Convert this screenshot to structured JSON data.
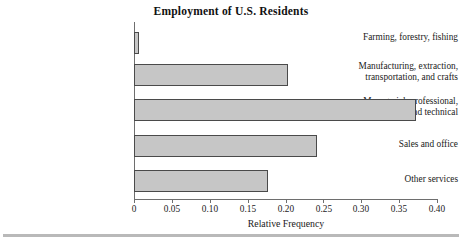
{
  "chart_data": {
    "type": "bar",
    "orientation": "horizontal",
    "title": "Employment of U.S. Residents",
    "xlabel": "Relative Frequency",
    "ylabel": "",
    "xlim": [
      0,
      0.4
    ],
    "grid": false,
    "legend": null,
    "categories": [
      "Farming, forestry, fishing",
      "Manufacturing, extraction, transportation, and crafts",
      "Managerial, professional, and technical",
      "Sales and office",
      "Other services"
    ],
    "category_lines": [
      [
        "Farming, forestry, fishing"
      ],
      [
        "Manufacturing, extraction,",
        "transportation, and crafts"
      ],
      [
        "Managerial, professional,",
        "and technical"
      ],
      [
        "Sales and office"
      ],
      [
        "Other services"
      ]
    ],
    "values": [
      0.007,
      0.203,
      0.372,
      0.242,
      0.177
    ],
    "xticks": [
      0,
      0.05,
      0.1,
      0.15,
      0.2,
      0.25,
      0.3,
      0.35,
      0.4
    ],
    "xtick_labels": [
      "0",
      "0.05",
      "0.10",
      "0.15",
      "0.20",
      "0.25",
      "0.30",
      "0.35",
      "0.40"
    ],
    "colors": {
      "bar_fill": "#c6c6c6",
      "bar_edge": "#4a4a4a",
      "axis": "#6e6e6e",
      "text": "#1a1a1a",
      "background": "#ffffff",
      "footer_rule": "#b9b9b9"
    }
  },
  "labels": {
    "cat_0_line_0": "Farming, forestry, fishing",
    "cat_1_line_0": "Manufacturing, extraction,",
    "cat_1_line_1": "transportation, and crafts",
    "cat_2_line_0": "Managerial, professional,",
    "cat_2_line_1": "and technical",
    "cat_3_line_0": "Sales and office",
    "cat_4_line_0": "Other services"
  },
  "xticklabels": {
    "t0": "0",
    "t1": "0.05",
    "t2": "0.10",
    "t3": "0.15",
    "t4": "0.20",
    "t5": "0.25",
    "t6": "0.30",
    "t7": "0.35",
    "t8": "0.40"
  }
}
